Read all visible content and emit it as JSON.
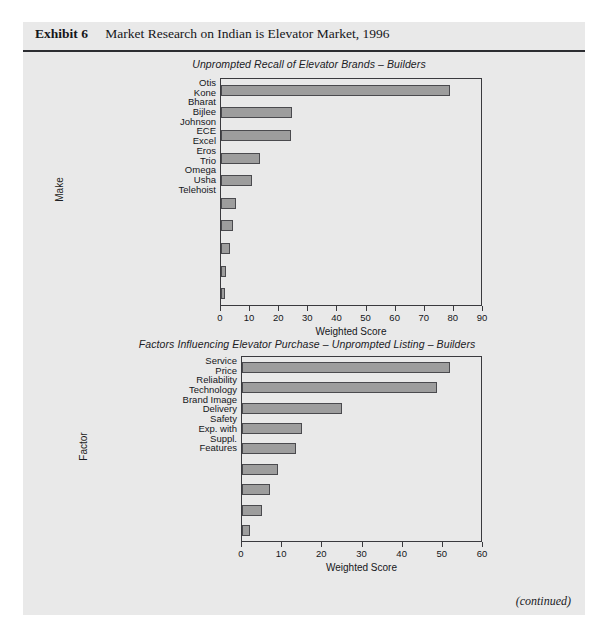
{
  "exhibit": {
    "label": "Exhibit 6",
    "caption": "Market Research on Indian is Elevator Market, 1996",
    "footer_note": "(continued)"
  },
  "colors": {
    "panel_background": "#e9e9e9",
    "page_background": "#ffffff",
    "bar_fill": "#9d9d9d",
    "bar_border": "#4a4a4e",
    "axis": "#3a3a3e",
    "rule": "#2c2d31",
    "text": "#15161a"
  },
  "chart_data": [
    {
      "type": "bar",
      "orientation": "horizontal",
      "id": "unprompted-recall",
      "title": "Unprompted Recall of Elevator Brands – Builders",
      "xlabel": "Weighted Score",
      "ylabel": "Make",
      "xlim": [
        0,
        90
      ],
      "xticks": [
        0,
        10,
        20,
        30,
        40,
        50,
        60,
        70,
        80,
        90
      ],
      "grid": false,
      "legend": null,
      "categories": [
        "Otis",
        "Kone",
        "Bharat\nBijlee",
        "Johnson",
        "ECE",
        "Excel",
        "Eros",
        "Trio",
        "Omega",
        "Usha\nTelehoist"
      ],
      "values": [
        78.5,
        24.5,
        24,
        13.5,
        10.5,
        5,
        4,
        3.2,
        1.6,
        1.5
      ]
    },
    {
      "type": "bar",
      "orientation": "horizontal",
      "id": "factors-influencing-purchase",
      "title": "Factors Influencing Elevator Purchase – Unprompted Listing – Builders",
      "xlabel": "Weighted Score",
      "ylabel": "Factor",
      "xlim": [
        0,
        60
      ],
      "xticks": [
        0,
        10,
        20,
        30,
        40,
        50,
        60
      ],
      "grid": false,
      "legend": null,
      "categories": [
        "Service",
        "Price",
        "Reliability",
        "Technology",
        "Brand Image",
        "Delivery",
        "Safety",
        "Exp. with\nSuppl.",
        "Features"
      ],
      "values": [
        51.8,
        48.5,
        25,
        15,
        13.4,
        9,
        7,
        5,
        2
      ]
    }
  ]
}
